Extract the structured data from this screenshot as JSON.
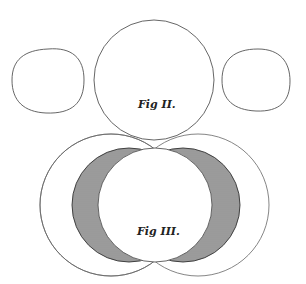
{
  "figures": {
    "fig2": {
      "label": "Fig II."
    },
    "fig3": {
      "label": "Fig III."
    }
  },
  "colors": {
    "background": "#ffffff",
    "line": "#555555",
    "hatch": "#333333",
    "text": "#222222"
  }
}
